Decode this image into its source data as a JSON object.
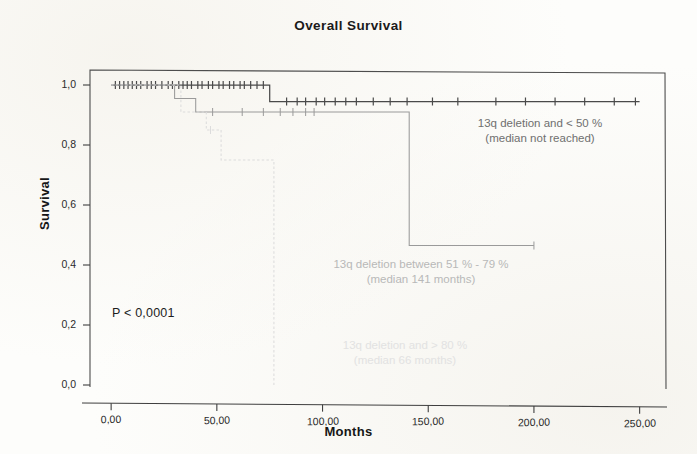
{
  "chart_data": {
    "type": "line",
    "title": "Overall Survival",
    "xlabel": "Months",
    "ylabel": "Survival",
    "xlim": [
      -10,
      262
    ],
    "ylim": [
      0,
      1.05
    ],
    "grid": false,
    "legend_position": "inline-annotations",
    "x_ticks": [
      "0,00",
      "50,00",
      "100,00",
      "150,00",
      "200,00",
      "250,00"
    ],
    "x_tick_values": [
      0,
      50,
      100,
      150,
      200,
      250
    ],
    "y_ticks": [
      "1,0",
      "0,8",
      "0,6",
      "0,4",
      "0,2",
      "0,0"
    ],
    "y_tick_values": [
      1.0,
      0.8,
      0.6,
      0.4,
      0.2,
      0.0
    ],
    "annotations": [
      {
        "text": "P < 0,0001",
        "x": 18,
        "y": 0.24
      }
    ],
    "series": [
      {
        "name": "13q deletion and < 50 %",
        "median": "median not reached",
        "color": "#4a4a4a",
        "style": "solid",
        "steps": [
          [
            0,
            1.0
          ],
          [
            75,
            1.0
          ],
          [
            75,
            0.945
          ],
          [
            250,
            0.945
          ]
        ],
        "censor_times": [
          2,
          4,
          6,
          8,
          10,
          12,
          14,
          17,
          19,
          21,
          24,
          27,
          29,
          32,
          34,
          36,
          38,
          41,
          43,
          46,
          48,
          51,
          53,
          56,
          58,
          61,
          63,
          66,
          69,
          72,
          83,
          88,
          92,
          97,
          101,
          106,
          111,
          116,
          124,
          132,
          140,
          152,
          164,
          182,
          196,
          210,
          224,
          238,
          248
        ],
        "censor_levels_note": "ticks at 1,0 before the step, at 0,945 after"
      },
      {
        "name": "13q deletion between 51 % - 79 %",
        "median": "median 141 months",
        "color": "#9a9a9a",
        "style": "solid",
        "steps": [
          [
            0,
            1.0
          ],
          [
            30,
            1.0
          ],
          [
            30,
            0.955
          ],
          [
            40,
            0.955
          ],
          [
            40,
            0.91
          ],
          [
            141,
            0.91
          ],
          [
            141,
            0.465
          ],
          [
            200,
            0.465
          ]
        ],
        "censor_times": [
          48,
          62,
          72,
          80,
          86,
          92,
          96,
          200
        ]
      },
      {
        "name": "13q deletion and > 80 %",
        "median": "median 66 months",
        "color": "#dcdcdc",
        "style": "dashed",
        "steps": [
          [
            0,
            1.0
          ],
          [
            33,
            1.0
          ],
          [
            33,
            0.91
          ],
          [
            45,
            0.91
          ],
          [
            45,
            0.85
          ],
          [
            52,
            0.85
          ],
          [
            52,
            0.75
          ],
          [
            77,
            0.75
          ],
          [
            77,
            0.0
          ]
        ],
        "censor_times": [
          47
        ]
      }
    ]
  },
  "labels": {
    "title": "Overall Survival",
    "x_axis": "Months",
    "y_axis": "Survival",
    "pvalue": "P < 0,0001",
    "group1_line1": "13q deletion and < 50 %",
    "group1_line2": "(median not reached)",
    "group2_line1": "13q deletion between 51 % - 79 %",
    "group2_line2": "(median 141 months)",
    "group3_line1": "13q deletion and > 80 %",
    "group3_line2": "(median 66 months)",
    "x_tick_0": "0,00",
    "x_tick_1": "50,00",
    "x_tick_2": "100,00",
    "x_tick_3": "150,00",
    "x_tick_4": "200,00",
    "x_tick_5": "250,00",
    "y_tick_0": "1,0",
    "y_tick_1": "0,8",
    "y_tick_2": "0,6",
    "y_tick_3": "0,4",
    "y_tick_4": "0,2",
    "y_tick_5": "0,0"
  }
}
